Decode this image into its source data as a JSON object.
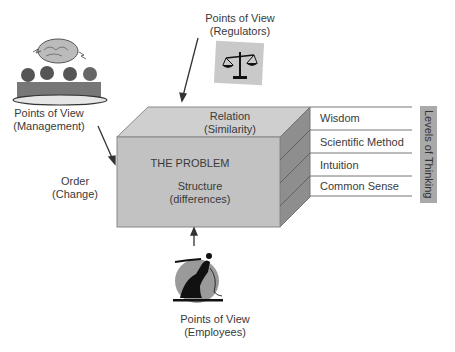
{
  "diagram": {
    "problem": {
      "title": "THE PROBLEM",
      "front_line1": "Structure",
      "front_line2": "(differences)",
      "top_line1": "Relation",
      "top_line2": "(Similarity)",
      "left_line1": "Order",
      "left_line2": "(Change)"
    },
    "viewpoints": [
      {
        "id": "management",
        "line1": "Points of View",
        "line2": "(Management)",
        "icon": "meeting-brain-icon"
      },
      {
        "id": "regulators",
        "line1": "Points of View",
        "line2": "(Regulators)",
        "icon": "scales-icon"
      },
      {
        "id": "employees",
        "line1": "Points of View",
        "line2": "(Employees)",
        "icon": "worker-icon"
      }
    ],
    "levels_title": "Levels of Thinking",
    "levels": [
      "Wisdom",
      "Scientific Method",
      "Intuition",
      "Common Sense"
    ],
    "colors": {
      "front": "#c2c2c2",
      "top": "#cfcfcf",
      "side": "#8e8e8e",
      "levels_bar": "#a9a9a9"
    }
  }
}
